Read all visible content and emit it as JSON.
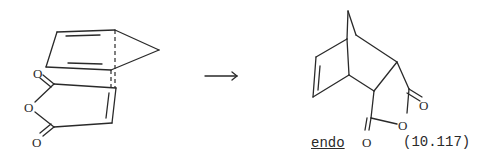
{
  "figure": {
    "reactant_label": "cyclopentadiene + maleic anhydride (transition state)",
    "product_stereo_label": "endo",
    "equation_number": "(10.117)",
    "arrow_direction": "right",
    "atom_labels": {
      "O": "O"
    },
    "ink_color": "#2a2a2a",
    "background_color": "#ffffff"
  }
}
